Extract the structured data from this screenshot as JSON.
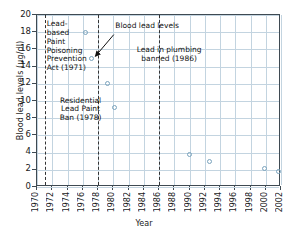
{
  "chart_data": {
    "type": "scatter",
    "title": "",
    "xlabel": "Year",
    "ylabel": "Blood lead levels (μg/dl)",
    "xlim": [
      1970,
      2002
    ],
    "ylim": [
      0,
      20
    ],
    "grid": true,
    "legend": "none",
    "series": [
      {
        "name": "Blood lead levels",
        "marker": "open-circle",
        "color": "#7aa3bd",
        "points": [
          {
            "x": 1976.3,
            "y": 18.0
          },
          {
            "x": 1977.2,
            "y": 15.0
          },
          {
            "x": 1979.2,
            "y": 12.0
          },
          {
            "x": 1980.1,
            "y": 9.2
          },
          {
            "x": 1990.0,
            "y": 3.8
          },
          {
            "x": 1992.6,
            "y": 3.0
          },
          {
            "x": 1999.8,
            "y": 2.1
          },
          {
            "x": 2001.7,
            "y": 1.8
          }
        ]
      }
    ],
    "xticks": [
      1970,
      1972,
      1974,
      1976,
      1978,
      1980,
      1982,
      1984,
      1986,
      1988,
      1990,
      1992,
      1994,
      1996,
      1998,
      2000,
      2002
    ],
    "yticks": [
      0,
      2,
      4,
      6,
      8,
      10,
      12,
      14,
      16,
      18,
      20
    ],
    "event_lines": [
      {
        "x": 1971,
        "label": "Lead-\nbased\nPaint\nPoisoning\nPrevention\nAct (1971)"
      },
      {
        "x": 1978,
        "label": "Residential\nLead Paint\nBan (1978)"
      },
      {
        "x": 1986,
        "label": "Lead in plumbing\nbanned (1986)"
      }
    ],
    "annotations": [
      {
        "text": "Blood lead levels",
        "points_to_x": 1977.2,
        "points_to_y": 15.0
      }
    ]
  },
  "axes": {
    "ylabel": "Blood lead levels (μg/dl)",
    "xlabel": "Year",
    "yticks": [
      "0",
      "2",
      "4",
      "6",
      "8",
      "10",
      "12",
      "14",
      "16",
      "18",
      "20"
    ],
    "xticks": [
      "1970",
      "1972",
      "1974",
      "1976",
      "1978",
      "1980",
      "1982",
      "1984",
      "1986",
      "1988",
      "1990",
      "1992",
      "1994",
      "1996",
      "1998",
      "2000",
      "2002"
    ]
  },
  "notes": {
    "act_1971": "Lead-\nbased\nPaint\nPoisoning\nPrevention\nAct (1971)",
    "ban_1978": "Residential\nLead Paint\nBan (1978)",
    "plumbing_1986": "Lead in plumbing\nbanned (1986)",
    "series_callout": "Blood lead levels"
  },
  "colors": {
    "marker": "#7aa3bd",
    "grid": "#c3d4e0",
    "frame": "#3f4a52",
    "text": "#1a1a1a"
  }
}
